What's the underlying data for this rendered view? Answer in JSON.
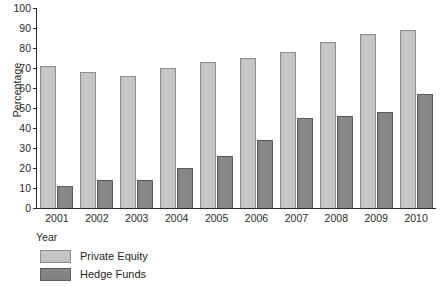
{
  "chart_data": {
    "type": "bar",
    "title": "",
    "xlabel": "Year",
    "ylabel": "Percentage",
    "categories": [
      "2001",
      "2002",
      "2003",
      "2004",
      "2005",
      "2006",
      "2007",
      "2008",
      "2009",
      "2010"
    ],
    "series": [
      {
        "name": "Private Equity",
        "color": "#c4c4c4",
        "values": [
          71,
          68,
          66,
          70,
          73,
          75,
          78,
          83,
          87,
          89
        ]
      },
      {
        "name": "Hedge Funds",
        "color": "#848484",
        "values": [
          11,
          14,
          14,
          20,
          26,
          34,
          45,
          46,
          48,
          57
        ]
      }
    ],
    "ylim": [
      0,
      100
    ],
    "yticks": [
      0,
      10,
      20,
      30,
      40,
      50,
      60,
      70,
      80,
      90,
      100
    ],
    "grid": false,
    "legend_position": "bottom-left"
  }
}
